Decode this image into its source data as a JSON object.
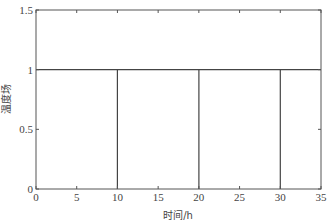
{
  "chart_data": {
    "type": "line",
    "title": "",
    "xlabel": "时间/h",
    "ylabel": "温度场",
    "xlim": [
      0,
      35
    ],
    "ylim": [
      0,
      1.5
    ],
    "xticks": [
      0,
      5,
      10,
      15,
      20,
      25,
      30,
      35
    ],
    "yticks": [
      0,
      0.5,
      1,
      1.5
    ],
    "xtick_labels": [
      "0",
      "5",
      "10",
      "15",
      "20",
      "25",
      "30",
      "35"
    ],
    "ytick_labels": [
      "0",
      "0.5",
      "1",
      "1.5"
    ],
    "grid": false,
    "legend": null,
    "series": [
      {
        "name": "温度场",
        "color": "#444444",
        "x": [
          0,
          10,
          10,
          10,
          20,
          20,
          20,
          30,
          30,
          30,
          35
        ],
        "y": [
          1,
          1,
          0,
          1,
          1,
          0,
          1,
          1,
          0,
          1,
          1
        ]
      }
    ]
  }
}
